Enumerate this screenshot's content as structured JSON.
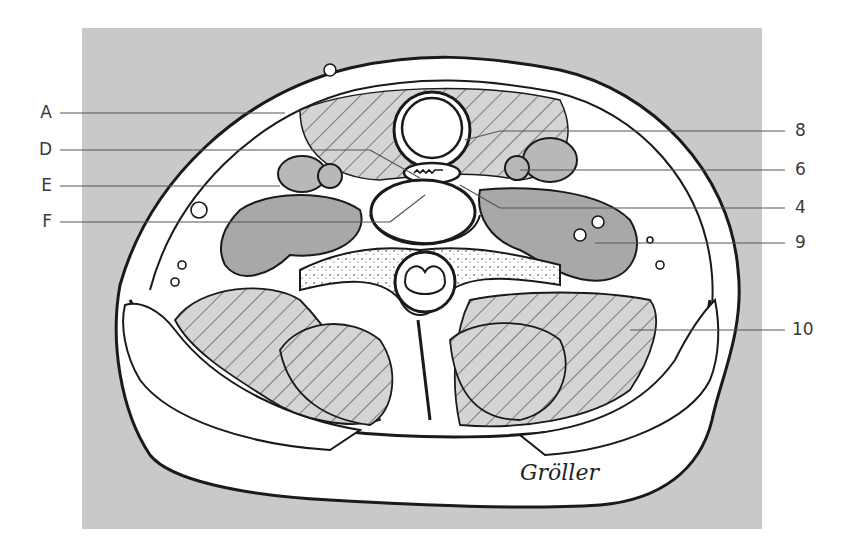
{
  "figure": {
    "signature": "Gröller",
    "colors": {
      "panel": "#c9c9c9",
      "tissue_fill": "#ffffff",
      "muscle_gray": "#a8a8a8",
      "outline": "#1a1a1a",
      "label_text": "#3a3a3a",
      "leader_line": "#555555"
    }
  },
  "labels": {
    "left": [
      {
        "text": "A",
        "y": 113
      },
      {
        "text": "D",
        "y": 150
      },
      {
        "text": "E",
        "y": 186
      },
      {
        "text": "F",
        "y": 222
      }
    ],
    "right": [
      {
        "text": "8",
        "y": 131
      },
      {
        "text": "6",
        "y": 170
      },
      {
        "text": "4",
        "y": 208
      },
      {
        "text": "9",
        "y": 243
      },
      {
        "text": "10",
        "y": 330
      }
    ]
  }
}
